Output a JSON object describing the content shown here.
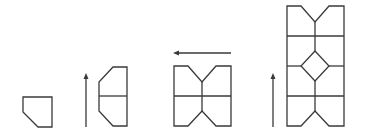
{
  "diagram": {
    "colors": {
      "stroke": "#3a3a3a",
      "background": "#ffffff"
    },
    "steps": [
      {
        "id": "tile",
        "label": ""
      },
      {
        "id": "reflect-up",
        "arrow": "up",
        "label": ""
      },
      {
        "id": "reflect-left",
        "arrow": "left",
        "label": ""
      },
      {
        "id": "reflect-up-2",
        "arrow": "up",
        "label": ""
      }
    ]
  }
}
